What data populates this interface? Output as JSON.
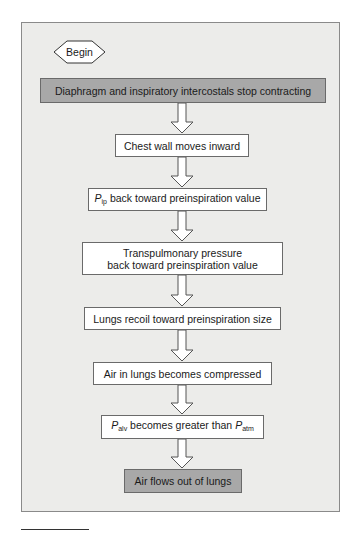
{
  "flowchart": {
    "start": "Begin",
    "steps": [
      {
        "text": "Diaphragm and inspiratory intercostals stop contracting",
        "style": "dark"
      },
      {
        "text": "Chest wall moves inward",
        "style": "light"
      },
      {
        "var": "P",
        "sub": "ip",
        "rest": " back toward preinspiration value",
        "style": "light"
      },
      {
        "line1": "Transpulmonary pressure",
        "line2": "back toward preinspiration value",
        "style": "light"
      },
      {
        "text": "Lungs recoil toward preinspiration size",
        "style": "light"
      },
      {
        "text": "Air in lungs becomes compressed",
        "style": "light"
      },
      {
        "var": "P",
        "sub": "alv",
        "mid": " becomes greater than ",
        "var2": "P",
        "sub2": "atm",
        "style": "light"
      },
      {
        "text": "Air flows out of lungs",
        "style": "dark"
      }
    ]
  },
  "colors": {
    "panel_bg": "#ececea",
    "dark_box": "#a8a8a8",
    "light_box": "#ffffff",
    "border": "#6a6a6a"
  }
}
